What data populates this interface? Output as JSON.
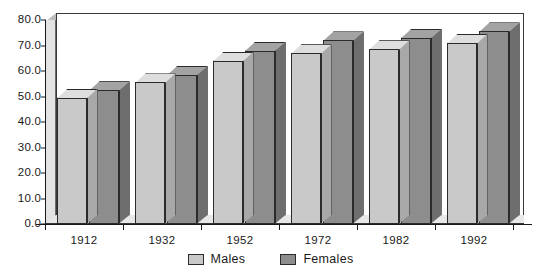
{
  "chart_data": {
    "type": "bar",
    "title": "",
    "subtitle": "",
    "xlabel": "",
    "ylabel": "",
    "categories": [
      "1912",
      "1932",
      "1952",
      "1972",
      "1982",
      "1992"
    ],
    "series": [
      {
        "name": "Males",
        "color": "#c9c9c9",
        "values": [
          49.5,
          55.5,
          64.0,
          67.0,
          68.5,
          71.0
        ]
      },
      {
        "name": "Females",
        "color": "#8d8d8d",
        "values": [
          52.5,
          58.5,
          68.0,
          72.0,
          73.0,
          75.5
        ]
      }
    ],
    "ylim": [
      0,
      80
    ],
    "ytick_step": 10,
    "ytick_labels": [
      "80.0",
      "70.0",
      "60.0",
      "50.0",
      "40.0",
      "30.0",
      "20.0",
      "10.0",
      "0.0"
    ],
    "ytick_values": [
      80,
      70,
      60,
      50,
      40,
      30,
      20,
      10,
      0
    ],
    "grid": false,
    "legend_position": "bottom-center",
    "style": "3d-clustered-column"
  },
  "legend": {
    "entries": [
      {
        "label": "Males",
        "swatch": "males-swatch"
      },
      {
        "label": "Females",
        "swatch": "females-swatch"
      }
    ]
  },
  "colors": {
    "males": "#c9c9c9",
    "males_top": "#dedede",
    "males_side": "#a8a8a8",
    "females": "#8d8d8d",
    "females_top": "#a3a3a3",
    "females_side": "#6e6e6e",
    "axis": "#1a1a1a",
    "wall": "#e3e3e3",
    "floor": "#e8e8e8",
    "plot_bg": "#ffffff"
  }
}
